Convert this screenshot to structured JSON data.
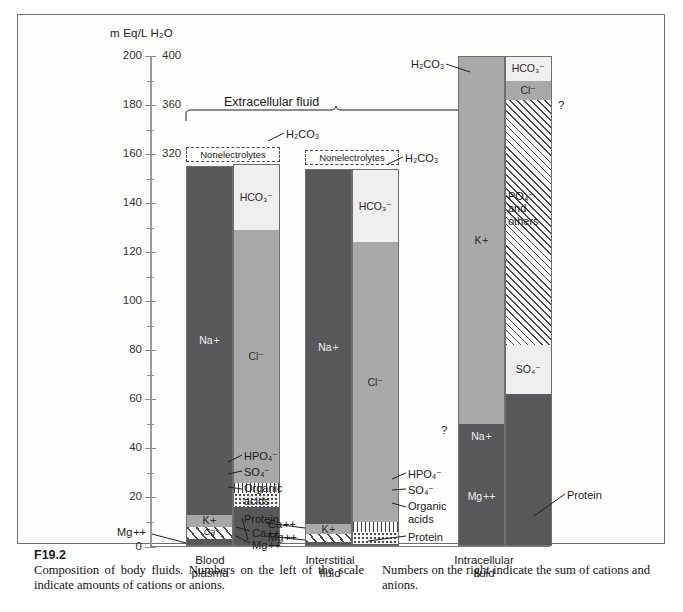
{
  "figure": {
    "number": "F19.2",
    "caption_left": "Composition of body fluids. Numbers on the left of the scale indicate amounts of cations or anions.",
    "caption_right": "Numbers on the right indicate the sum of cations and anions.",
    "unit_header": "m Eq/L H₂O",
    "group_title": "Extracellular fluid"
  },
  "axis": {
    "left_label_values": [
      "200",
      "180",
      "160",
      "140",
      "120",
      "100",
      "80",
      "60",
      "40",
      "20",
      "0"
    ],
    "right_label_values": [
      "400",
      "380",
      "360",
      "340",
      "320",
      "300"
    ],
    "left_min": 0,
    "left_max": 200,
    "left_step": 20,
    "minor_step": 10,
    "right_min": 300,
    "right_max": 400,
    "right_step": 20
  },
  "columns": {
    "blood_plasma": {
      "caption": "Blood\nplasma",
      "nonelectrolytes": "Nonelectrolytes",
      "cations": [
        {
          "name": "Na +",
          "value": 142,
          "fill": "f-dark",
          "label": "Na +"
        },
        {
          "name": "K +",
          "value": 5,
          "fill": "f-mid",
          "label": "K +"
        },
        {
          "name": "Ca ++",
          "value": 5,
          "fill": "f-diag-wide",
          "label": "Ca"
        },
        {
          "name": "Mg ++",
          "value": 3,
          "fill": "f-dark",
          "label": ""
        }
      ],
      "anions": [
        {
          "name": "HCO3",
          "value": 27,
          "fill": "f-light",
          "label": "HCO₃⁻"
        },
        {
          "name": "Cl -",
          "value": 103,
          "fill": "f-mid",
          "label": "Cl⁻"
        },
        {
          "name": "HPO4 / SO4",
          "value": 4,
          "fill": "f-vstripe",
          "label": ""
        },
        {
          "name": "Organic acids",
          "value": 6,
          "fill": "f-dots",
          "label": ""
        },
        {
          "name": "Protein",
          "value": 16,
          "fill": "f-dark",
          "label": ""
        }
      ]
    },
    "interstitial_fluid": {
      "caption": "Interstitial\nfluid",
      "nonelectrolytes": "Nonelectrolytes",
      "cations": [
        {
          "name": "Na +",
          "value": 145,
          "fill": "f-dark",
          "label": "Na +"
        },
        {
          "name": "K +",
          "value": 4,
          "fill": "f-mid",
          "label": "K +"
        },
        {
          "name": "Ca ++",
          "value": 3,
          "fill": "f-diag-wide",
          "label": ""
        },
        {
          "name": "Mg ++",
          "value": 2,
          "fill": "f-dark",
          "label": ""
        }
      ],
      "anions": [
        {
          "name": "HCO3",
          "value": 30,
          "fill": "f-light",
          "label": "HCO₃⁻"
        },
        {
          "name": "Cl -",
          "value": 114,
          "fill": "f-mid",
          "label": "Cl⁻"
        },
        {
          "name": "HPO4 / SO4",
          "value": 4,
          "fill": "f-vstripe",
          "label": ""
        },
        {
          "name": "Organic acids",
          "value": 5,
          "fill": "f-dots",
          "label": ""
        },
        {
          "name": "Protein",
          "value": 1,
          "fill": "f-dark",
          "label": ""
        }
      ]
    },
    "intracellular_fluid": {
      "caption": "Intracellular\nfluid",
      "cations": [
        {
          "name": "K +",
          "value": 150,
          "fill": "f-mid",
          "label": "K +"
        },
        {
          "name": "Na +",
          "value": 10,
          "fill": "f-dark",
          "label": "Na +"
        },
        {
          "name": "Mg ++",
          "value": 40,
          "fill": "f-dark",
          "label": "Mg ++"
        }
      ],
      "anions": [
        {
          "name": "HCO3",
          "value": 10,
          "fill": "f-light",
          "label": "HCO₃⁻"
        },
        {
          "name": "Cl -",
          "value": 8,
          "fill": "f-mid",
          "label": "Cl⁻"
        },
        {
          "name": "PO4 and others",
          "value": 100,
          "fill": "f-diag",
          "label": ""
        },
        {
          "name": "SO4",
          "value": 20,
          "fill": "f-light",
          "label": "SO₄⁻"
        },
        {
          "name": "Protein",
          "value": 62,
          "fill": "f-dark",
          "label": ""
        }
      ]
    }
  },
  "annotations": {
    "h2co3": "H₂CO₃",
    "hco3": "HCO₃⁻",
    "cl": "Cl⁻",
    "na": "Na +",
    "k": "K +",
    "mg": "Mg ++",
    "ca": "Ca ++",
    "hpo4": "HPO₄⁻",
    "so4": "SO₄⁻",
    "organic": "Organic",
    "acids": "acids",
    "protein": "Protein",
    "po4_and": "PO₄⁻",
    "and": "and",
    "others": "others",
    "question": "?"
  }
}
